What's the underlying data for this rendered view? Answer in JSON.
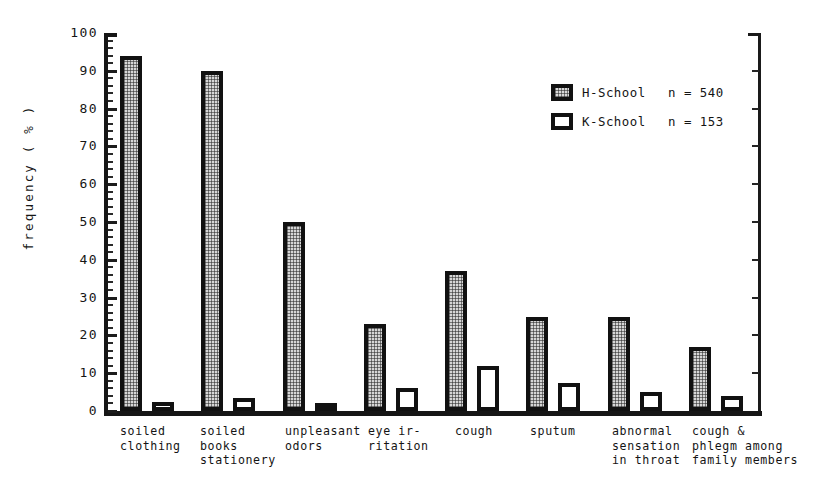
{
  "chart_data": {
    "type": "bar",
    "title": "",
    "xlabel": "",
    "ylabel": "frequency ( % )",
    "ylim": [
      0,
      100
    ],
    "ytick_step": 10,
    "yticks": [
      0,
      10,
      20,
      30,
      40,
      50,
      60,
      70,
      80,
      90,
      100
    ],
    "ytick_labels": [
      "0",
      "10",
      "20",
      "30",
      "40",
      "50",
      "60",
      "70",
      "80",
      "90",
      "100"
    ],
    "grid": false,
    "legend_position": "upper right",
    "categories": [
      "soiled\nclothing",
      "soiled\nbooks\nstationery",
      "unpleasant\nodors",
      "eye ir-\nritation",
      "cough",
      "sputum",
      "abnormal\nsensation\nin throat",
      "cough &\nphlegm among\nfamily members"
    ],
    "series": [
      {
        "name": "H-School",
        "n_label": "n = 540",
        "fill": "hatched-gray",
        "values": [
          94,
          90,
          50,
          23,
          37,
          25,
          25,
          17
        ]
      },
      {
        "name": "K-School",
        "n_label": "n = 153",
        "fill": "white",
        "values": [
          2.5,
          3.5,
          1.5,
          6,
          12,
          7.5,
          5,
          4
        ]
      }
    ],
    "colors": {
      "axis": "#161616",
      "bar_outline": "#111111",
      "h_school_fill": "#d6d6d6",
      "k_school_fill": "#ffffff",
      "text": "#141414"
    }
  }
}
